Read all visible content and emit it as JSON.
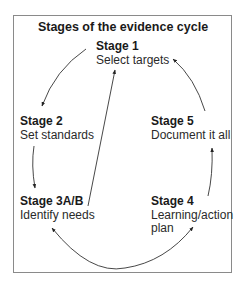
{
  "diagram": {
    "title": "Stages of the evidence cycle",
    "stages": [
      {
        "id": "stage-1",
        "heading": "Stage 1",
        "label": "Select targets"
      },
      {
        "id": "stage-2",
        "heading": "Stage 2",
        "label": "Set standards"
      },
      {
        "id": "stage-3",
        "heading": "Stage 3A/B",
        "label": "Identify needs"
      },
      {
        "id": "stage-4",
        "heading": "Stage 4",
        "label_line1": "Learning/action",
        "label_line2": "plan"
      },
      {
        "id": "stage-5",
        "heading": "Stage 5",
        "label": "Document it all"
      }
    ],
    "arrows": [
      {
        "from": "Stage 1",
        "to": "Stage 2"
      },
      {
        "from": "Stage 2",
        "to": "Stage 3A/B"
      },
      {
        "from": "Stage 3A/B",
        "to": "Stage 4"
      },
      {
        "from": "Stage 4",
        "to": "Stage 5"
      },
      {
        "from": "Stage 5",
        "to": "Stage 1"
      },
      {
        "from": "Stage 3A/B",
        "to": "Stage 1"
      }
    ],
    "colors": {
      "line": "#333333",
      "border": "#8a8a8a",
      "text": "#222222"
    }
  }
}
